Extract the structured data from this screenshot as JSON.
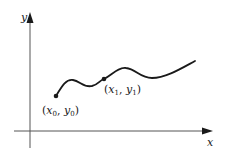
{
  "diagram": {
    "type": "function-curve-on-axes",
    "axes": {
      "x_label": "x",
      "y_label": "y"
    },
    "points": [
      {
        "name": "x0y0",
        "label_open": "(",
        "x_var": "x",
        "x_sub": "0",
        "sep": ", ",
        "y_var": "y",
        "y_sub": "0",
        "label_close": ")"
      },
      {
        "name": "x1y1",
        "label_open": "(",
        "x_var": "x",
        "x_sub": "1",
        "sep": ", ",
        "y_var": "y",
        "y_sub": "1",
        "label_close": ")"
      }
    ],
    "colors": {
      "ink": "#1a1a1a",
      "axis": "#555555",
      "background": "#ffffff"
    }
  }
}
